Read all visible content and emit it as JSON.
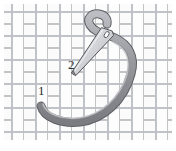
{
  "figure": {
    "kind": "needlework-instruction-illustration",
    "background_color": "#ffffff",
    "canvas": {
      "width": 176,
      "height": 151
    }
  },
  "fabric": {
    "name": "basketweave-fabric",
    "weave_fill": "#fdfdfd",
    "weave_stroke": "#b9bcc0",
    "shadow_fill": "#f0f0f1",
    "tile_size": 24,
    "strap_width": 11,
    "area": {
      "x": 4,
      "y": 4,
      "width": 168,
      "height": 136
    }
  },
  "thread": {
    "name": "thread-cord",
    "body_color": "#93949a",
    "outline_color": "#5d5e63",
    "highlight_color": "#c6c7cc",
    "width": 7,
    "description": "Gray cord entering at point 1, sweeping right and up, curling into a hook at the top"
  },
  "needle": {
    "name": "sewing-needle",
    "body_color": "#d9dade",
    "outline_color": "#55565b",
    "eye_color": "#ffffff",
    "tip": {
      "x": 72,
      "y": 72
    },
    "eye": {
      "x": 107,
      "y": 33
    },
    "description": "Thin tapered needle angled down-left, eye at upper right, point near label 2"
  },
  "labels": [
    {
      "name": "stitch-point-1",
      "text": "1",
      "x": 38,
      "y": 84,
      "color": "#2b2b2b"
    },
    {
      "name": "stitch-point-2",
      "text": "2",
      "x": 68,
      "y": 58,
      "color": "#2b2b2b"
    }
  ]
}
